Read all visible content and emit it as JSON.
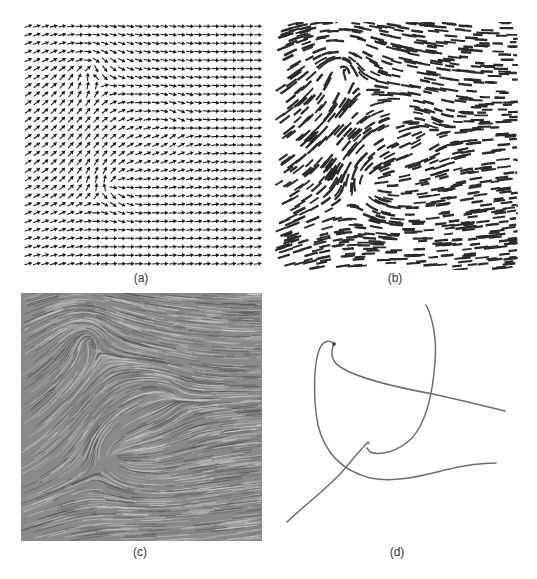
{
  "figure": {
    "panels": [
      {
        "id": "a",
        "caption": "(a)",
        "technique": "arrow-glyph-plot",
        "box": {
          "x": 24,
          "y": 22,
          "w": 238,
          "h": 246
        },
        "caption_pos": {
          "x": 141,
          "y": 271
        },
        "grid": {
          "cols": 28,
          "rows": 29
        },
        "glyph_color": "#1a1a1a"
      },
      {
        "id": "b",
        "caption": "(b)",
        "technique": "streamlets",
        "box": {
          "x": 275,
          "y": 22,
          "w": 243,
          "h": 248
        },
        "caption_pos": {
          "x": 395,
          "y": 271
        },
        "glyph_color": "#2a2a2a"
      },
      {
        "id": "c",
        "caption": "(c)",
        "technique": "line-integral-convolution",
        "box": {
          "x": 21,
          "y": 293,
          "w": 241,
          "h": 248
        },
        "caption_pos": {
          "x": 140,
          "y": 545
        },
        "background": "#8a8a8a",
        "streak_light": "#d6d6d6",
        "streak_dark": "#4a4a4a"
      },
      {
        "id": "d",
        "caption": "(d)",
        "technique": "streamlines",
        "box": {
          "x": 268,
          "y": 285,
          "w": 269,
          "h": 260
        },
        "caption_pos": {
          "x": 397,
          "y": 545
        },
        "line_color": "#6e6e6e",
        "curves": [
          {
            "name": "streamline-1",
            "d": "M426,305 C433,318 437,340 435,362 C433,390 428,420 412,438 C398,452 380,456 370,452 L367,448"
          },
          {
            "name": "streamline-2",
            "d": "M334,344 C331,340 325,340 321,346 C313,360 313,400 318,425 C324,450 340,470 370,478 C395,483 420,476 445,470 C465,465 480,463 496,463"
          },
          {
            "name": "streamline-3",
            "d": "M334,344 C330,352 331,362 342,368 C360,379 400,388 433,394 C460,400 485,406 505,411"
          },
          {
            "name": "streamline-4",
            "d": "M287,522 C305,505 325,490 340,474 C350,463 358,452 368,442"
          }
        ],
        "seed_points": [
          {
            "x": 334,
            "y": 344,
            "color": "#333333"
          },
          {
            "x": 368,
            "y": 443,
            "color": "#9a9a9a"
          }
        ]
      }
    ],
    "vector_field": {
      "description": "2D flow with a spiral critical point (upper-left), a node (lower-center) and a saddle (right-center); far field flows left-to-right",
      "critical_points": [
        {
          "type": "spiral",
          "u": 0.27,
          "v": 0.18,
          "strength": 1.0,
          "rotation": 1.0
        },
        {
          "type": "node",
          "u": 0.38,
          "v": 0.66,
          "strength": 0.9,
          "rotation": 0.35
        },
        {
          "type": "saddle",
          "u": 0.66,
          "v": 0.44,
          "strength": 0.7
        }
      ],
      "uniform": {
        "x": 1.0,
        "y": -0.15
      }
    }
  }
}
